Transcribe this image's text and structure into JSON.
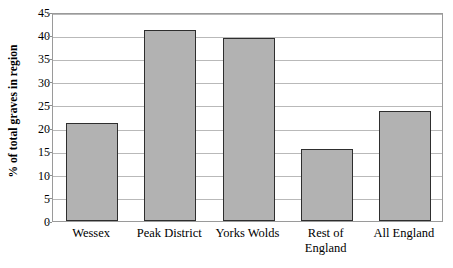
{
  "chart_data": {
    "type": "bar",
    "title": "",
    "xlabel": "",
    "ylabel": "% of total graves in region",
    "categories": [
      "Wessex",
      "Peak District",
      "Yorks Wolds",
      "Rest of England",
      "All England"
    ],
    "values": [
      21.0,
      41.2,
      39.4,
      15.4,
      23.6
    ],
    "ylim": [
      0,
      45
    ],
    "ytick_step": 5,
    "yticks": [
      0,
      5,
      10,
      15,
      20,
      25,
      30,
      35,
      40,
      45
    ],
    "ytick_labels": [
      "0",
      "5",
      "10",
      "15",
      "20",
      "25",
      "30",
      "35",
      "40",
      "45"
    ],
    "grid": true,
    "grid_axis": "y",
    "legend": false,
    "legend_position": "none",
    "bar_fill_color": "#b2b2b2",
    "bar_edge_color": "#2e2e2e",
    "grid_color": "#b9b9b9",
    "frame_color": "#9a9a9a",
    "text_color": "#000000",
    "background_color": "#ffffff"
  },
  "category_label_lines": [
    [
      "Wessex"
    ],
    [
      "Peak District"
    ],
    [
      "Yorks Wolds"
    ],
    [
      "Rest of",
      "England"
    ],
    [
      "All England"
    ]
  ]
}
